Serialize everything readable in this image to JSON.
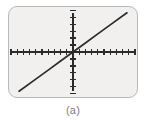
{
  "figure": {
    "caption": "(a)",
    "screen_bg": "#f1f0ee",
    "screen_border": "#b9b9b9",
    "ink_color": "#2b2b2b",
    "caption_color": "#7b7b7b"
  },
  "chart_data": {
    "type": "line",
    "title": "",
    "xlabel": "",
    "ylabel": "",
    "grid": false,
    "legend": null,
    "axes_style": "tick-marked cartesian axes crossing at origin",
    "xlim": [
      -10,
      10
    ],
    "ylim": [
      -6.2,
      6.2
    ],
    "x_tick_step": 1,
    "y_tick_step": 1,
    "x_tick_count": 20,
    "y_tick_count": 12,
    "series": [
      {
        "name": "y = 0.65x",
        "slope": 0.65,
        "intercept": 0,
        "x": [
          -8.7,
          -6,
          -4,
          -2,
          0,
          2,
          4,
          6,
          8.7
        ],
        "values": [
          -5.65,
          -3.9,
          -2.6,
          -1.3,
          0,
          1.3,
          2.6,
          3.9,
          5.65
        ],
        "style": "solid",
        "color": "#2b2b2b"
      }
    ]
  }
}
